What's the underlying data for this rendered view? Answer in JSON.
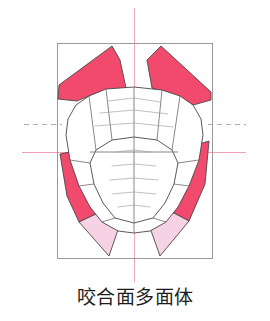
{
  "figure": {
    "caption": "咬合面多面体",
    "canvas": {
      "width": 270,
      "height": 321,
      "background": "#ffffff"
    },
    "frame": {
      "name": "bounding-box",
      "x": 57,
      "y": 43,
      "width": 155,
      "height": 215,
      "stroke": "#9a9a9a",
      "stroke_width": 1,
      "fill": "none"
    },
    "axes": {
      "vertical_center_line": {
        "x": 134,
        "y1": 8,
        "y2": 282,
        "color": "#f0a8b6",
        "style": "solid",
        "width": 1
      },
      "horizontal_solid_line": {
        "y": 152,
        "x1": 22,
        "x2": 246,
        "color": "#f0a0b0",
        "style": "solid",
        "width": 1
      },
      "horizontal_dashed_left": {
        "y": 124,
        "x1": 24,
        "x2": 62,
        "color": "#b9a8ad",
        "style": "dashed",
        "width": 1
      },
      "horizontal_dashed_right": {
        "y": 124,
        "x1": 208,
        "x2": 246,
        "color": "#b9a8ad",
        "style": "dashed",
        "width": 1
      }
    },
    "colors": {
      "deep_pink": "#F24A6D",
      "light_pink": "#F6D2E4",
      "outline": "#4a4446",
      "thin_outline": "#8b8488",
      "frame_gray": "#9a9a9a",
      "axis_pink": "#f0a4b4",
      "white_facet": "#ffffff",
      "caption_text": "#1d1d1d"
    },
    "facets": {
      "pink_upper_left": {
        "label": "upper-left-incisal-facet",
        "color": "#F24A6D",
        "points": "58,99 59,85 112,46 120,60 126,88 96,93 77,101"
      },
      "pink_upper_right": {
        "label": "upper-right-incisal-facet",
        "color": "#F24A6D",
        "points": "161,46 211,92 211,100 193,105 170,94 152,88 147,60"
      },
      "pink_lower_left": {
        "label": "lower-left-buccal-facet",
        "color": "#F24A6D",
        "points": "60,154 75,151 84,186 96,214 79,222 67,196"
      },
      "pink_lower_right": {
        "label": "lower-right-buccal-facet",
        "color": "#F24A6D",
        "points": "196,145 209,141 205,184 189,221 174,213 186,180"
      },
      "lightpink_lower_left": {
        "label": "lower-left-lingual-facet",
        "color": "#F6D2E4",
        "points": "96,214 79,222 109,256 120,224 116,212"
      },
      "lightpink_lower_right": {
        "label": "lower-right-lingual-facet",
        "color": "#F6D2E4",
        "points": "174,213 189,221 160,256 149,225 153,212"
      }
    },
    "arch": {
      "label": "occlusal-polyhedron-arch",
      "outer_outline": "106,89 134,87 162,90 180,96 193,105 201,119 203,135 199,160 189,186 178,207 166,222 150,231 134,233 118,231 102,222 90,207 79,186 70,160 66,135 68,119 76,105 89,96",
      "inner_outline": "112,140 134,137 157,140 172,150 178,163 174,184 165,203 153,218 134,223 115,218 103,203 94,184 90,163 96,150",
      "ridge_lines": [
        "134,87 134,233",
        "90,152 178,152",
        "106,89 112,140",
        "162,90 157,140",
        "89,96 96,150",
        "180,96 172,150",
        "70,160 90,163",
        "199,160 178,163",
        "79,186 94,184",
        "189,186 174,184",
        "102,222 115,218",
        "166,222 153,218"
      ],
      "contour_lines": [
        "108,101 134,98 160,102",
        "100,113 134,110 168,114",
        "95,126 134,123 173,127",
        "116,152 134,150 152,152",
        "112,166 134,164 156,166",
        "110,180 134,178 158,180",
        "112,194 134,192 156,194",
        "118,207 134,205 150,207"
      ]
    }
  }
}
